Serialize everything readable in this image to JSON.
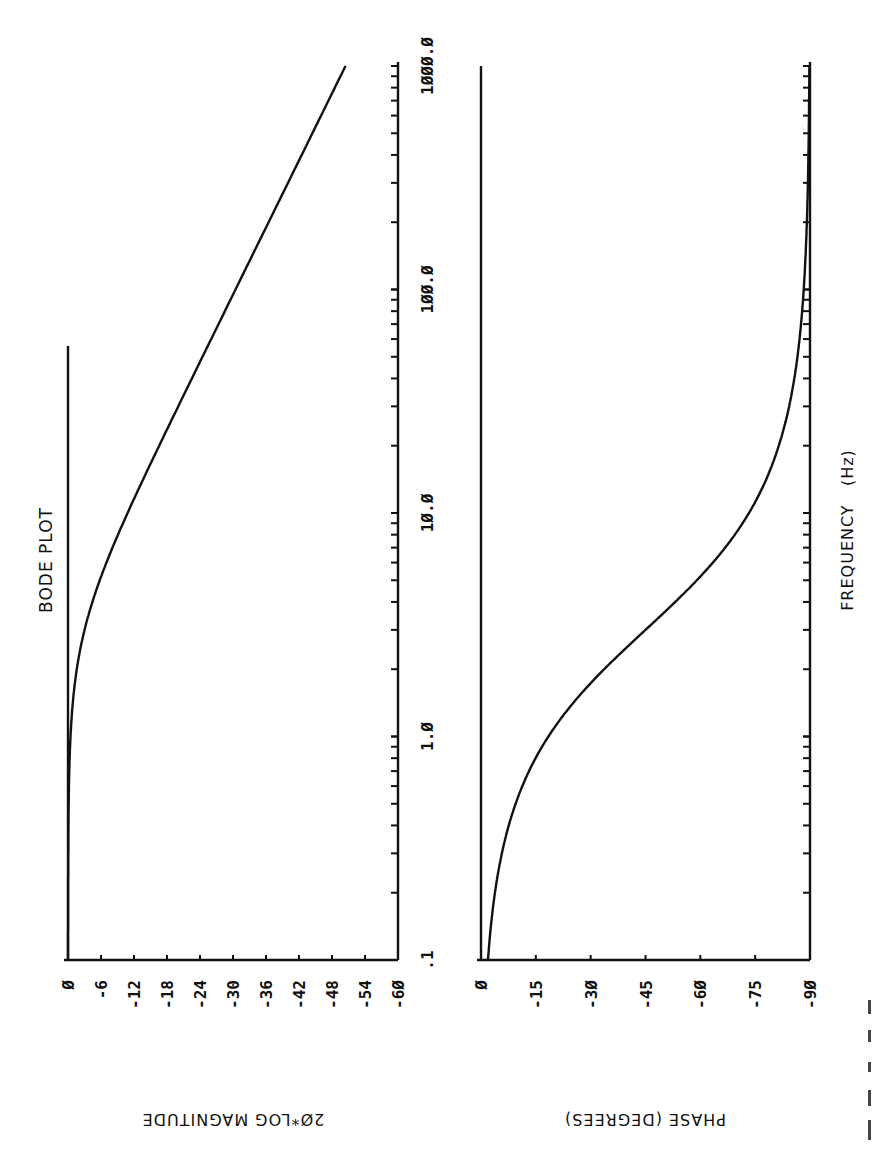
{
  "chart_data": [
    {
      "type": "line",
      "title": "BODE PLOT",
      "panel": "magnitude",
      "xlabel": "FREQUENCY (Hz)",
      "ylabel": "20*LOG MAGNITUDE",
      "x_scale": "log",
      "xlim": [
        0.1,
        1000.0
      ],
      "ylim": [
        -60,
        0
      ],
      "x_tick_labels": [
        ".1",
        "1.0",
        "10.0",
        "100.0",
        "1000.0"
      ],
      "x_ticks": [
        0.1,
        1.0,
        10.0,
        100.0,
        1000.0
      ],
      "y_ticks": [
        0,
        -6,
        -12,
        -18,
        -24,
        -30,
        -36,
        -42,
        -48,
        -54,
        -60
      ],
      "y_tick_labels": [
        "Ø",
        "-6",
        "-12",
        "-18",
        "-24",
        "-30",
        "-36",
        "-42",
        "-48",
        "-54",
        "-6Ø"
      ],
      "grid": false,
      "series": [
        {
          "name": "magnitude_dB",
          "x": [
            0.1,
            0.2,
            0.5,
            1.0,
            2.0,
            3.0,
            5.0,
            10.0,
            20.0,
            50.0,
            100.0,
            200.0,
            500.0,
            1000.0
          ],
          "values": [
            0.0,
            -0.02,
            -0.12,
            -0.46,
            -1.6,
            -3.0,
            -5.8,
            -10.8,
            -16.6,
            -24.5,
            -30.5,
            -36.5,
            -44.4,
            -50.5
          ]
        }
      ]
    },
    {
      "type": "line",
      "panel": "phase",
      "xlabel": "FREQUENCY (Hz)",
      "ylabel": "PHASE (DEGREES)",
      "x_scale": "log",
      "xlim": [
        0.1,
        1000.0
      ],
      "ylim": [
        -90,
        0
      ],
      "x_tick_labels": [
        ".1",
        "1.0",
        "10.0",
        "100.0",
        "1000.0"
      ],
      "x_ticks": [
        0.1,
        1.0,
        10.0,
        100.0,
        1000.0
      ],
      "y_ticks": [
        0,
        -15,
        -30,
        -45,
        -60,
        -75,
        -90
      ],
      "y_tick_labels": [
        "Ø",
        "-15",
        "-3Ø",
        "-45",
        "-6Ø",
        "-75",
        "-9Ø"
      ],
      "grid": false,
      "series": [
        {
          "name": "phase_deg",
          "x": [
            0.1,
            0.2,
            0.5,
            1.0,
            2.0,
            3.0,
            5.0,
            10.0,
            20.0,
            50.0,
            100.0,
            200.0,
            500.0,
            1000.0
          ],
          "values": [
            -1.9,
            -3.8,
            -9.5,
            -18.4,
            -33.7,
            -45.0,
            -59.0,
            -73.3,
            -81.5,
            -86.6,
            -88.3,
            -89.1,
            -89.7,
            -89.8
          ]
        }
      ]
    }
  ],
  "labels": {
    "title": "BODE PLOT",
    "x_axis": "FREQUENCY   (Hz)",
    "mag_y_axis": "2Ø*LOG MAGNITUDE",
    "phase_y_axis": "PHASE (DEGREES)"
  },
  "model": {
    "corner_frequency_hz": 3.0
  },
  "style": {
    "ink": "#111111",
    "background": "#ffffff"
  }
}
